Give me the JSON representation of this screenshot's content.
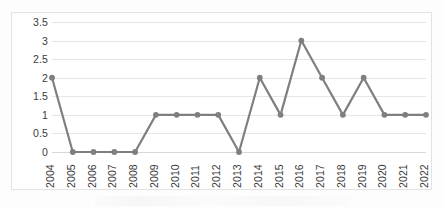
{
  "chart_data": {
    "type": "line",
    "title": "",
    "subtitle": "",
    "xlabel": "",
    "ylabel": "",
    "categories": [
      "2004",
      "2005",
      "2006",
      "2007",
      "2008",
      "2009",
      "2010",
      "2011",
      "2012",
      "2013",
      "2014",
      "2015",
      "2016",
      "2017",
      "2018",
      "2019",
      "2020",
      "2021",
      "2022"
    ],
    "values": [
      2,
      0,
      0,
      0,
      0,
      1,
      1,
      1,
      1,
      0,
      2,
      1,
      3,
      2,
      1,
      2,
      1,
      1,
      1
    ],
    "series": [
      {
        "name": "",
        "values": [
          2,
          0,
          0,
          0,
          0,
          1,
          1,
          1,
          1,
          0,
          2,
          1,
          3,
          2,
          1,
          2,
          1,
          1,
          1
        ]
      }
    ],
    "ylim": [
      0,
      3.5
    ],
    "y_ticks": [
      0,
      0.5,
      1,
      1.5,
      2,
      2.5,
      3,
      3.5
    ],
    "y_tick_labels": [
      "0",
      "0.5",
      "1",
      "1.5",
      "2",
      "2.5",
      "3",
      "3.5"
    ],
    "grid": true,
    "grid_axis": "y",
    "legend": false,
    "legend_position": "none",
    "markers": true,
    "marker_shape": "circle",
    "x_tick_rotation": -90,
    "annotations": []
  },
  "style": {
    "series_color": "#7f7f7f",
    "marker_color": "#7f7f7f",
    "gridline_color": "#e6e6e6",
    "baseline_color": "#d8d8d8",
    "frame_border_color": "#e2e2e2",
    "tick_label_color": "#3a3a3a",
    "plot_background": "#ffffff",
    "page_background": "#fdfdfd"
  }
}
